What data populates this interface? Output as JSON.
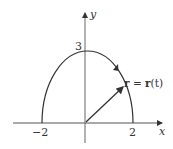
{
  "diagram": {
    "x_axis_label": "x",
    "y_axis_label": "y",
    "tick_labels": {
      "x_neg": "−2",
      "x_pos": "2",
      "y_top": "3"
    },
    "vector_label_bold_r": "r",
    "vector_label_eq": " = ",
    "vector_label_bold_r2": "r",
    "vector_label_arg": "(t)",
    "curve": "half-ellipse from (-2,0) through (0,3) to (2,0)",
    "colors": {
      "stroke": "#333333"
    }
  }
}
